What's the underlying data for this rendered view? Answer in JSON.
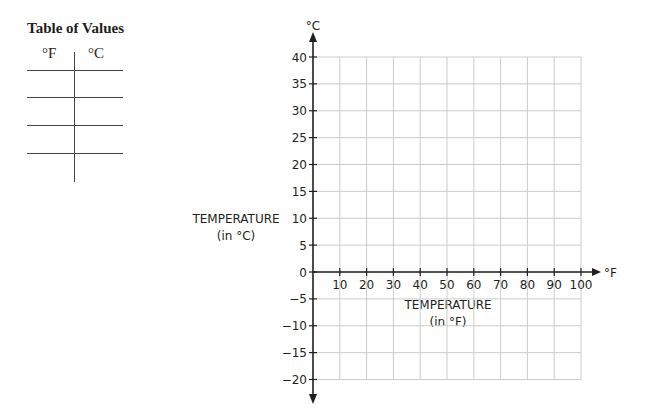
{
  "table": {
    "title": "Table of Values",
    "headers": [
      "°F",
      "°C"
    ],
    "rows": [
      [
        "",
        ""
      ],
      [
        "",
        ""
      ],
      [
        "",
        ""
      ],
      [
        "",
        ""
      ]
    ]
  },
  "graph": {
    "y_unit": "°C",
    "x_unit": "°F",
    "y_title_line1": "TEMPERATURE",
    "y_title_line2": "(in °C)",
    "x_title_line1": "TEMPERATURE",
    "x_title_line2": "(in °F)",
    "grid_color": "#cccccc",
    "axis_color": "#231f20"
  },
  "chart_data": {
    "type": "line",
    "title": "",
    "xlabel": "TEMPERATURE (in °F)",
    "ylabel": "TEMPERATURE (in °C)",
    "x_unit": "°F",
    "y_unit": "°C",
    "xlim": [
      0,
      100
    ],
    "ylim": [
      -20,
      40
    ],
    "x_ticks": [
      10,
      20,
      30,
      40,
      50,
      60,
      70,
      80,
      90,
      100
    ],
    "y_ticks": [
      40,
      35,
      30,
      25,
      20,
      15,
      10,
      5,
      0,
      -5,
      -10,
      -15,
      -20
    ],
    "grid": true,
    "series": [],
    "table_of_values": {
      "title": "Table of Values",
      "columns": [
        "°F",
        "°C"
      ],
      "rows": [
        [
          "",
          ""
        ],
        [
          "",
          ""
        ],
        [
          "",
          ""
        ],
        [
          "",
          ""
        ]
      ]
    }
  }
}
